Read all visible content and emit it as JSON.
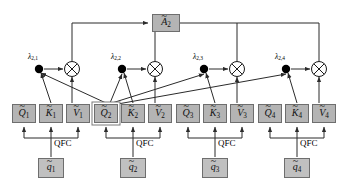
{
  "diagram": {
    "type": "node-graph",
    "colors": {
      "box_fill": "#b4b4b4",
      "box_fill_light": "#c0c0c0",
      "box_border": "#6e6e6e",
      "wire": "#2b2b2b",
      "node_dot": "#000000",
      "background": "#ffffff",
      "highlight_outline": "#ffffff"
    },
    "output": {
      "label": "A",
      "sub": "2",
      "accent": "tilde",
      "name": "output-attention"
    },
    "lambdas": [
      {
        "label": "λ",
        "sub": "2,1"
      },
      {
        "label": "λ",
        "sub": "2,2"
      },
      {
        "label": "λ",
        "sub": "2,3"
      },
      {
        "label": "λ",
        "sub": "2,4"
      }
    ],
    "multiply_symbol": "⊗",
    "multiply_count": 4,
    "qfc_label": "QFC",
    "qfc_count": 4,
    "tokens": [
      {
        "index": "1",
        "input": {
          "label": "q",
          "sub": "1"
        },
        "q": {
          "label": "Q",
          "sub": "1"
        },
        "k": {
          "label": "K",
          "sub": "1"
        },
        "v": {
          "label": "V",
          "sub": "1"
        },
        "highlighted": false
      },
      {
        "index": "2",
        "input": {
          "label": "q",
          "sub": "2"
        },
        "q": {
          "label": "Q",
          "sub": "2"
        },
        "k": {
          "label": "K",
          "sub": "2"
        },
        "v": {
          "label": "V",
          "sub": "2"
        },
        "highlighted": true
      },
      {
        "index": "3",
        "input": {
          "label": "q",
          "sub": "3"
        },
        "q": {
          "label": "Q",
          "sub": "3"
        },
        "k": {
          "label": "K",
          "sub": "3"
        },
        "v": {
          "label": "V",
          "sub": "3"
        },
        "highlighted": false
      },
      {
        "index": "4",
        "input": {
          "label": "q",
          "sub": "4"
        },
        "q": {
          "label": "Q",
          "sub": "4"
        },
        "k": {
          "label": "K",
          "sub": "4"
        },
        "v": {
          "label": "V",
          "sub": "4"
        },
        "highlighted": false
      }
    ]
  }
}
